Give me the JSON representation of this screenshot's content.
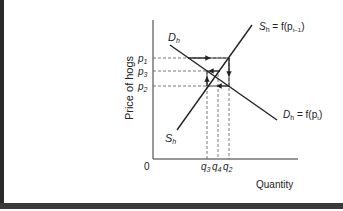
{
  "diagram": {
    "y_axis_label": "Price of hogs",
    "x_axis_label": "Quantity",
    "origin_label": "0",
    "supply_curve": {
      "label_top": "S",
      "label_top_sub": "h",
      "label_top_eq": " = f(p",
      "label_top_eq_sub": "t−1",
      "label_top_close": ")",
      "label_bottom": "S",
      "label_bottom_sub": "h"
    },
    "demand_curve": {
      "label_top": "D",
      "label_top_sub": "h",
      "label_bottom": "D",
      "label_bottom_sub": "h",
      "label_bottom_eq": " = f(p",
      "label_bottom_eq_sub": "t",
      "label_bottom_close": ")"
    },
    "price_levels": [
      {
        "letter": "p",
        "sub": "1"
      },
      {
        "letter": "p",
        "sub": "3"
      },
      {
        "letter": "p",
        "sub": "2"
      }
    ],
    "quantity_levels": [
      {
        "letter": "q",
        "sub": "3"
      },
      {
        "letter": "q",
        "sub": "4"
      },
      {
        "letter": "q",
        "sub": "2"
      }
    ],
    "colors": {
      "line": "#222222",
      "dashed": "#555555",
      "border": "#2a2a2a"
    }
  }
}
